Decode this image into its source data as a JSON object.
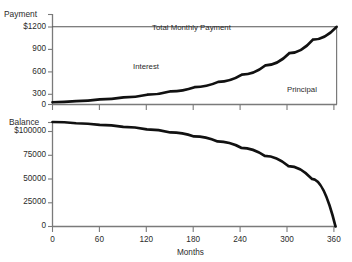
{
  "chart_data": [
    {
      "type": "area",
      "id": "payment-panel",
      "title": "",
      "ylabel": "Payment",
      "xlabel": "",
      "ylim": [
        0,
        1200
      ],
      "xlim": [
        0,
        360
      ],
      "ytick_labels": [
        "$1200",
        "900",
        "600",
        "300",
        "0"
      ],
      "ytick_values": [
        1200,
        900,
        600,
        300,
        0
      ],
      "xtick_values": [
        0,
        60,
        120,
        180,
        240,
        300,
        360
      ],
      "xtick_labels": [
        "",
        "",
        "",
        "",
        "",
        "",
        ""
      ],
      "grid": false,
      "annotations": [
        {
          "text": "Total Monthly Payment",
          "x": 180,
          "y": 1075
        },
        {
          "text": "Interest",
          "x": 125,
          "y": 620
        },
        {
          "text": "Principal",
          "x": 300,
          "y": 300
        }
      ],
      "series": [
        {
          "name": "Total Monthly Payment",
          "type": "line",
          "x": [
            0,
            360
          ],
          "values": [
            1030,
            1030
          ]
        },
        {
          "name": "Principal",
          "type": "line",
          "x": [
            0,
            30,
            60,
            90,
            120,
            150,
            180,
            210,
            240,
            270,
            300,
            330,
            360
          ],
          "values": [
            30,
            45,
            68,
            95,
            130,
            175,
            230,
            300,
            395,
            520,
            680,
            860,
            1030
          ]
        }
      ]
    },
    {
      "type": "line",
      "id": "balance-panel",
      "title": "",
      "ylabel": "Balance",
      "xlabel": "Months",
      "ylim": [
        0,
        100000
      ],
      "xlim": [
        0,
        360
      ],
      "ytick_labels": [
        "$100000",
        "75000",
        "50000",
        "25000",
        "0"
      ],
      "ytick_values": [
        100000,
        75000,
        50000,
        25000,
        0
      ],
      "xtick_values": [
        0,
        60,
        120,
        180,
        240,
        300,
        360
      ],
      "xtick_labels": [
        "0",
        "60",
        "120",
        "180",
        "240",
        "300",
        "360"
      ],
      "grid": false,
      "annotations": [],
      "series": [
        {
          "name": "Balance",
          "type": "line",
          "x": [
            0,
            30,
            60,
            90,
            120,
            150,
            180,
            210,
            240,
            270,
            300,
            330,
            360
          ],
          "values": [
            100000,
            98800,
            97300,
            95400,
            93000,
            90000,
            86200,
            81400,
            75300,
            67600,
            57800,
            45500,
            0
          ]
        }
      ]
    }
  ],
  "labels": {
    "payment_axis_title": "Payment",
    "balance_axis_title": "Balance",
    "months_axis_title": "Months",
    "total_monthly_payment": "Total Monthly Payment",
    "interest": "Interest",
    "principal": "Principal",
    "payment_ticks": [
      "$1200",
      "900",
      "600",
      "300",
      "0"
    ],
    "balance_ticks": [
      "$100000",
      "75000",
      "50000",
      "25000",
      "0"
    ],
    "month_ticks": [
      "0",
      "60",
      "120",
      "180",
      "240",
      "300",
      "360"
    ]
  },
  "colors": {
    "background": "#ffffff",
    "axis": "#7a7a7a",
    "curve": "#111111",
    "thin_line": "#555555",
    "text": "#2b2b2b"
  }
}
